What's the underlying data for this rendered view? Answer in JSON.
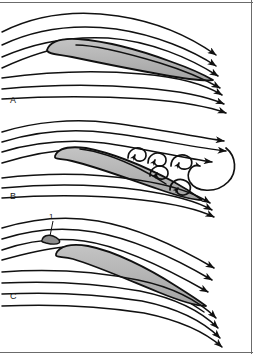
{
  "figure": {
    "width": 253,
    "height": 354,
    "background_color": "#ffffff",
    "border_color": "#6b6b6b",
    "stroke_color": "#111111",
    "airfoil_fill": "#b3b3b3",
    "airfoil_stroke": "#111111"
  },
  "panels": [
    {
      "id": "A",
      "label": "A",
      "caption": "Attached streamline flow over airfoil at low angle of attack",
      "label_x": 10,
      "label_y": 103,
      "streamline_count_upper": 4,
      "streamline_count_lower": 3,
      "arrow_count": 6,
      "separated": false,
      "vortex_count": 0,
      "slat": false
    },
    {
      "id": "B",
      "label": "B",
      "caption": "Separated stalled flow with shed vortices at high angle of attack",
      "label_x": 10,
      "label_y": 199,
      "streamline_count_upper": 4,
      "streamline_count_lower": 3,
      "arrow_count": 5,
      "separated": true,
      "vortex_count": 6,
      "slat": false
    },
    {
      "id": "C",
      "label": "C",
      "caption": "Reattached flow with leading-edge slat fitted",
      "label_x": 10,
      "label_y": 299,
      "streamline_count_upper": 4,
      "streamline_count_lower": 3,
      "arrow_count": 6,
      "separated": false,
      "vortex_count": 0,
      "slat": true
    }
  ],
  "callouts": [
    {
      "id": "1",
      "label": "1",
      "description": "leading-edge slat",
      "label_x": 52,
      "label_y": 217,
      "leader_x1": 53,
      "leader_y1": 221,
      "leader_x2": 50,
      "leader_y2": 236
    }
  ],
  "icons": {
    "arrowhead": "flow-arrow-icon",
    "vortex": "vortex-spiral-icon",
    "slat": "slat-element-icon"
  }
}
